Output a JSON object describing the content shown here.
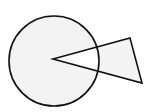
{
  "diagram": {
    "type": "geometry",
    "background": "#ffffff",
    "fill_color": "#f3f3f3",
    "stroke_color": "#111111",
    "stroke_width": 1.6,
    "circle": {
      "cx": 54,
      "cy": 61,
      "r": 45
    },
    "triangle": {
      "points": [
        [
          53,
          59
        ],
        [
          130,
          38
        ],
        [
          142,
          83
        ]
      ]
    },
    "fill_rule": "evenodd"
  }
}
